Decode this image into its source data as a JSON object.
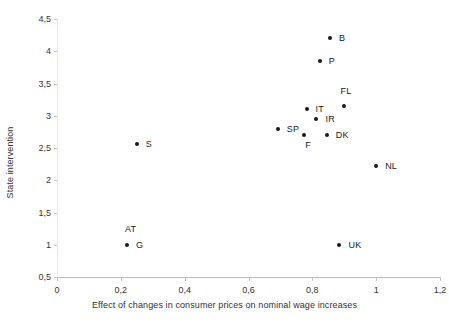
{
  "chart_data": {
    "type": "scatter",
    "title": "",
    "xlabel": "Effect of changes in consumer prices on nominal wage increases",
    "ylabel": "State intervention",
    "xlim": [
      0,
      1.2
    ],
    "ylim": [
      0.5,
      4.5
    ],
    "grid": false,
    "legend": "none",
    "decimal_separator": ",",
    "x_ticks": [
      "0",
      "0,2",
      "0,4",
      "0,6",
      "0,8",
      "1",
      "1,2"
    ],
    "x_tick_values": [
      0,
      0.2,
      0.4,
      0.6,
      0.8,
      1.0,
      1.2
    ],
    "y_ticks": [
      "0,5",
      "1",
      "1,5",
      "2",
      "2,5",
      "3",
      "3,5",
      "4",
      "4,5"
    ],
    "y_tick_values": [
      0.5,
      1.0,
      1.5,
      2.0,
      2.5,
      3.0,
      3.5,
      4.0,
      4.5
    ],
    "points": [
      {
        "label": "B",
        "x": 0.855,
        "y": 4.2,
        "label_dx": 9,
        "label_dy": -5
      },
      {
        "label": "P",
        "x": 0.823,
        "y": 3.855,
        "label_dx": 9,
        "label_dy": -5
      },
      {
        "label": "FL",
        "x": 0.898,
        "y": 3.155,
        "label_dx": -3,
        "label_dy": -20
      },
      {
        "label": "IT",
        "x": 0.782,
        "y": 3.11,
        "label_dx": 9,
        "label_dy": -5
      },
      {
        "label": "IR",
        "x": 0.813,
        "y": 2.955,
        "label_dx": 9,
        "label_dy": -5
      },
      {
        "label": "SP",
        "x": 0.692,
        "y": 2.8,
        "label_dx": 9,
        "label_dy": -5
      },
      {
        "label": "F",
        "x": 0.775,
        "y": 2.705,
        "label_dx": 1,
        "label_dy": 5
      },
      {
        "label": "DK",
        "x": 0.845,
        "y": 2.705,
        "label_dx": 9,
        "label_dy": -5
      },
      {
        "label": "S",
        "x": 0.25,
        "y": 2.56,
        "label_dx": 9,
        "label_dy": -5
      },
      {
        "label": "NL",
        "x": 1.0,
        "y": 2.225,
        "label_dx": 9,
        "label_dy": -5
      },
      {
        "label": "AT",
        "x": 0.219,
        "y": 1.0,
        "label_dx": -2,
        "label_dy": -21
      },
      {
        "label": "G",
        "x": 0.219,
        "y": 1.0,
        "label_dx": 9,
        "label_dy": -5
      },
      {
        "label": "UK",
        "x": 0.885,
        "y": 1.0,
        "label_dx": 9,
        "label_dy": -5
      }
    ]
  },
  "axes": {
    "y_title": "State intervention",
    "x_title": "Effect of changes in consumer prices on nominal wage increases"
  },
  "colors": {
    "marker": "#1a1a1a",
    "axis_line": "#b9b9b9",
    "tick": "#c2c2c2",
    "text": "#333333",
    "background": "#ffffff"
  }
}
